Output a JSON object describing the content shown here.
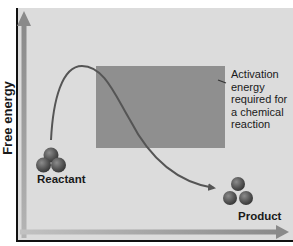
{
  "diagram": {
    "type": "energy-profile",
    "y_axis_label": "Free energy",
    "x_axis_label": "",
    "annotation": "Activation energy required for a chemical reaction",
    "nodes": [
      {
        "id": "reactant",
        "label": "Reactant",
        "shape": "three-sphere-molecule"
      },
      {
        "id": "product",
        "label": "Product",
        "shape": "three-sphere-molecule"
      }
    ],
    "edges": [
      {
        "from": "reactant",
        "to": "product",
        "shape": "curve-over-energy-barrier"
      }
    ],
    "regions": [
      {
        "name": "activation-energy-band",
        "description": "shaded band between reactant level and transition-state peak"
      }
    ],
    "colors": {
      "panel_background": "#dcdcdc",
      "activation_band": "#8f8f8f",
      "curve": "#555555",
      "axis_arrow": "#9a9a9a",
      "molecule": "#5a5a5a",
      "frame": "#111111"
    }
  }
}
